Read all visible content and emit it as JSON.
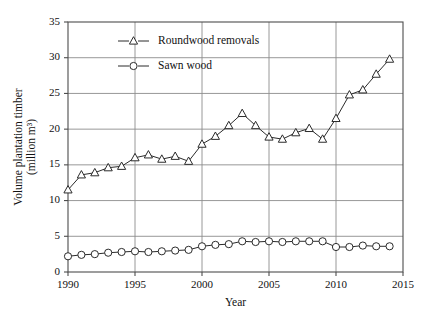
{
  "chart_data": {
    "type": "line",
    "title": "",
    "xlabel": "Year",
    "ylabel": "Volume plantation timber (million m³)",
    "ylabel_line1": "Volume plantation timber",
    "ylabel_line2": "(million m³)",
    "xlim": [
      1990,
      2015
    ],
    "ylim": [
      0,
      35
    ],
    "xticks": [
      1990,
      1995,
      2000,
      2005,
      2010,
      2015
    ],
    "yticks": [
      0,
      5,
      10,
      15,
      20,
      25,
      30,
      35
    ],
    "grid": "both",
    "legend_position": "upper-left-inside",
    "x": [
      1990,
      1991,
      1992,
      1993,
      1994,
      1995,
      1996,
      1997,
      1998,
      1999,
      2000,
      2001,
      2002,
      2003,
      2004,
      2005,
      2006,
      2007,
      2008,
      2009,
      2010,
      2011,
      2012,
      2013,
      2014
    ],
    "series": [
      {
        "name": "Roundwood removals",
        "marker": "open-triangle",
        "color": "#2b2b2b",
        "values": [
          11.5,
          13.6,
          13.9,
          14.6,
          14.8,
          16.0,
          16.4,
          15.8,
          16.2,
          15.5,
          17.9,
          19.0,
          20.5,
          22.2,
          20.5,
          18.9,
          18.6,
          19.5,
          20.1,
          18.6,
          21.5,
          24.8,
          25.5,
          27.7,
          29.8
        ]
      },
      {
        "name": "Sawn wood",
        "marker": "open-circle",
        "color": "#2b2b2b",
        "values": [
          2.2,
          2.4,
          2.5,
          2.7,
          2.8,
          2.9,
          2.8,
          2.9,
          3.0,
          3.1,
          3.6,
          3.8,
          3.9,
          4.3,
          4.2,
          4.3,
          4.2,
          4.3,
          4.3,
          4.3,
          3.5,
          3.5,
          3.7,
          3.6,
          3.6
        ]
      }
    ]
  }
}
